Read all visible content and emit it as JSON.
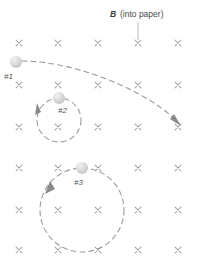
{
  "figure": {
    "title_label": "B",
    "title_note": "(into paper)",
    "background_color": "#ffffff",
    "field_symbol": "x",
    "field_symbol_color": "#9a9a9a",
    "trajectory_color": "#9b9b9b",
    "particle_color": "#d8d8d8",
    "width": 197,
    "height": 270
  },
  "field_grid": {
    "columns_x": [
      19,
      58,
      98,
      138,
      178
    ],
    "rows_y": [
      43,
      85,
      127,
      168,
      210,
      250
    ],
    "symbol": "×",
    "description": "magnetic field into the page"
  },
  "leader_line": {
    "x": 138,
    "y_start": 22,
    "y_end": 40
  },
  "label_position": {
    "b_x": 110,
    "text_x": 120,
    "y": 17
  },
  "particles": [
    {
      "id": "p1",
      "label": "#1",
      "cx": 16,
      "cy": 62,
      "r": 6,
      "label_x": 4,
      "label_y": 79,
      "path_type": "large-arc",
      "path": "M 22 61 C 70 61 140 85 178 122",
      "arrow_tip": [
        180,
        125
      ],
      "arrow_angle": 44,
      "direction": "clockwise-rightward"
    },
    {
      "id": "p2",
      "label": "#2",
      "cx": 59,
      "cy": 98,
      "r": 6,
      "label_x": 58,
      "label_y": 113,
      "path_type": "circle",
      "circle_cx": 59,
      "circle_cy": 120,
      "circle_r": 22,
      "arrow_tip": [
        38,
        105
      ],
      "arrow_angle": -70,
      "direction": "counterclockwise"
    },
    {
      "id": "p3",
      "label": "#3",
      "cx": 82,
      "cy": 168,
      "r": 6,
      "label_x": 74,
      "label_y": 185,
      "path_type": "circle",
      "circle_cx": 82,
      "circle_cy": 210,
      "circle_r": 42,
      "arrow_tip": [
        50,
        183
      ],
      "arrow_angle": -52,
      "direction": "counterclockwise"
    }
  ]
}
